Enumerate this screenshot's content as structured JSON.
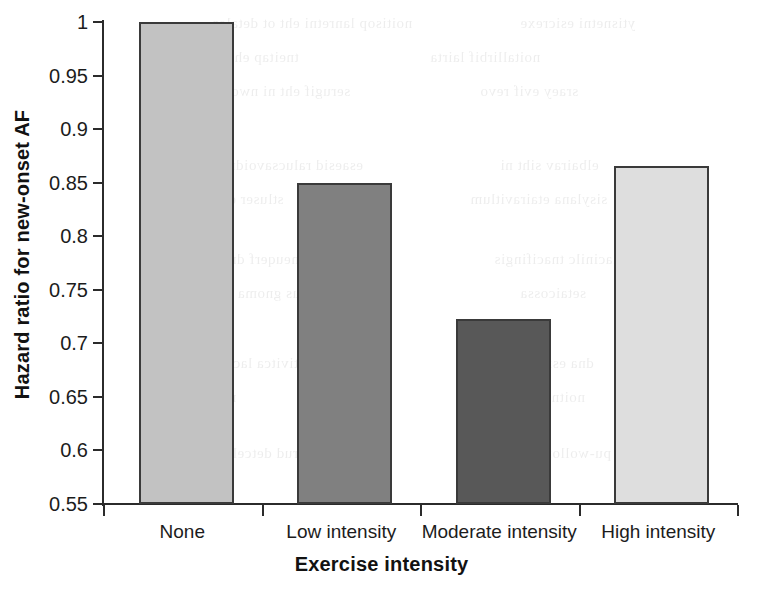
{
  "chart_data": {
    "type": "bar",
    "title": "",
    "xlabel": "Exercise intensity",
    "ylabel": "Hazard ratio for new-onset AF",
    "categories": [
      "None",
      "Low intensity",
      "Moderate intensity",
      "High intensity"
    ],
    "values": [
      1.0,
      0.85,
      0.7225,
      0.866
    ],
    "ylim": [
      0.55,
      1.0
    ],
    "ytick_labels": [
      "1",
      "0.95",
      "0.9",
      "0.85",
      "0.8",
      "0.75",
      "0.7",
      "0.65",
      "0.6",
      "0.55"
    ],
    "ytick_values": [
      1.0,
      0.95,
      0.9,
      0.85,
      0.8,
      0.75,
      0.7,
      0.65,
      0.6,
      0.55
    ],
    "grid": false,
    "legend": false,
    "bar_colors": [
      "#c2c2c2",
      "#808080",
      "#585858",
      "#dedede"
    ],
    "bar_border_color": "#3a3a3a",
    "axis_color": "#2b2b2b"
  },
  "background_bleed": [
    {
      "text": "noitisop lanretni eht ot detaler",
      "x": 213,
      "y": 8
    },
    {
      "text": "ytisnetni esicrexe",
      "x": 520,
      "y": 8
    },
    {
      "text": "tneitap eht fo ydob eht",
      "x": 150,
      "y": 42
    },
    {
      "text": "noitallirbif lairta",
      "x": 430,
      "y": 42
    },
    {
      "text": "serugif eht ni nwohs sa",
      "x": 198,
      "y": 76
    },
    {
      "text": "sraey evif revo",
      "x": 480,
      "y": 76
    },
    {
      "text": "noitaler eht",
      "x": 148,
      "y": 110
    },
    {
      "text": "esaesid ralucsavoidrac fo ksir",
      "x": 168,
      "y": 150
    },
    {
      "text": "elbairav siht ni",
      "x": 500,
      "y": 150
    },
    {
      "text": "stluser eht gnitropeR",
      "x": 146,
      "y": 184
    },
    {
      "text": "sisylana etairavitlum",
      "x": 470,
      "y": 184
    },
    {
      "text": "ycneuqerf dna noitarud",
      "x": 162,
      "y": 244
    },
    {
      "text": "lacinilc tnacifingis",
      "x": 494,
      "y": 244
    },
    {
      "text": "stcejbus gnoma decuder saw",
      "x": 152,
      "y": 278
    },
    {
      "text": "setaicossa",
      "x": 520,
      "y": 278
    },
    {
      "text": "slevel ytivitca lacisyhp hgih",
      "x": 164,
      "y": 348
    },
    {
      "text": "dna esicrexe",
      "x": 512,
      "y": 348
    },
    {
      "text": "noisulcnoc ni",
      "x": 148,
      "y": 382
    },
    {
      "text": "noitnetta eriuqer",
      "x": 476,
      "y": 382
    },
    {
      "text": "gnirud detcelloc atad eht",
      "x": 156,
      "y": 438
    },
    {
      "text": "pu-wollof fo doirep",
      "x": 482,
      "y": 438
    },
    {
      "text": "eroferehT",
      "x": 150,
      "y": 472
    }
  ]
}
